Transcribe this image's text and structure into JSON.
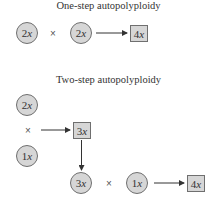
{
  "diagram": {
    "one_step": {
      "title": "One-step autopolyploidy",
      "parent_a": {
        "num": "2",
        "x": "x"
      },
      "cross_symbol": "×",
      "parent_b": {
        "num": "2",
        "x": "x"
      },
      "product": {
        "num": "4",
        "x": "x"
      }
    },
    "two_step": {
      "title": "Two-step autopolyploidy",
      "parent_a": {
        "num": "2",
        "x": "x"
      },
      "cross_symbol_1": "×",
      "parent_b": {
        "num": "1",
        "x": "x"
      },
      "intermediate": {
        "num": "3",
        "x": "x"
      },
      "intermediate_parent": {
        "num": "3",
        "x": "x"
      },
      "cross_symbol_2": "×",
      "parent_c": {
        "num": "1",
        "x": "x"
      },
      "product": {
        "num": "4",
        "x": "x"
      }
    },
    "colors": {
      "fill": "#d6d6d6",
      "stroke": "#6f6f6f",
      "arrow": "#333333"
    }
  }
}
